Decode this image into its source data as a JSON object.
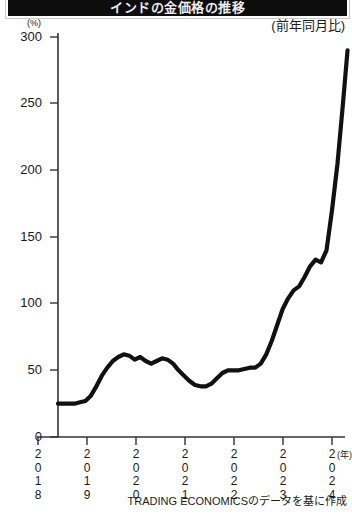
{
  "titlebar": {
    "text": "インドの金価格の推移"
  },
  "annotations": {
    "y_unit": "(%)",
    "x_unit": "(年)",
    "yoy_note": "(前年同月比)",
    "source": "TRADING ECONOMICSのデータを基に作成"
  },
  "axis": {
    "y_ticks": [
      "300",
      "250",
      "200",
      "150",
      "100",
      "50",
      "0"
    ],
    "x_ticks": [
      {
        "digits": [
          "2",
          "0",
          "1",
          "8"
        ]
      },
      {
        "digits": [
          "2",
          "0",
          "1",
          "9"
        ]
      },
      {
        "digits": [
          "2",
          "0",
          "2",
          "0"
        ]
      },
      {
        "digits": [
          "2",
          "0",
          "2",
          "1"
        ]
      },
      {
        "digits": [
          "2",
          "0",
          "2",
          "2"
        ]
      },
      {
        "digits": [
          "2",
          "0",
          "2",
          "3"
        ]
      },
      {
        "digits": [
          "2",
          "0",
          "2",
          "4"
        ]
      }
    ]
  },
  "colors": {
    "line": "#111111",
    "axis": "#333333",
    "background": "#ffffff",
    "titlebar": "#0d0d0d"
  },
  "chart_data": {
    "type": "line",
    "title": "インドの金価格の推移",
    "subtitle": "(前年同月比)",
    "xlabel": "(年)",
    "ylabel": "(%)",
    "xlim": [
      2018.0,
      2024.4
    ],
    "ylim": [
      0,
      300
    ],
    "ytick_values": [
      0,
      50,
      100,
      150,
      200,
      250,
      300
    ],
    "xtick_values": [
      2018,
      2019,
      2020,
      2021,
      2022,
      2023,
      2024
    ],
    "grid": false,
    "legend": null,
    "source": "TRADING ECONOMICSのデータを基に作成",
    "series": [
      {
        "name": "前年同月比",
        "x": [
          2018.0,
          2018.12,
          2018.24,
          2018.36,
          2018.48,
          2018.6,
          2018.72,
          2018.84,
          2018.96,
          2019.08,
          2019.2,
          2019.32,
          2019.44,
          2019.56,
          2019.68,
          2019.8,
          2019.92,
          2020.04,
          2020.16,
          2020.28,
          2020.4,
          2020.52,
          2020.64,
          2020.76,
          2020.88,
          2021.0,
          2021.12,
          2021.24,
          2021.36,
          2021.48,
          2021.6,
          2021.72,
          2021.84,
          2021.96,
          2022.08,
          2022.2,
          2022.32,
          2022.44,
          2022.56,
          2022.68,
          2022.8,
          2022.92,
          2023.04,
          2023.16,
          2023.28,
          2023.4,
          2023.52,
          2023.64,
          2023.76,
          2023.88,
          2024.0,
          2024.12,
          2024.24,
          2024.34
        ],
        "y": [
          25,
          25,
          25,
          25,
          26,
          27,
          31,
          38,
          46,
          52,
          57,
          60,
          62,
          61,
          58,
          60,
          57,
          55,
          57,
          59,
          58,
          55,
          50,
          46,
          42,
          39,
          38,
          38,
          40,
          44,
          48,
          50,
          50,
          50,
          51,
          52,
          52,
          55,
          62,
          72,
          84,
          96,
          104,
          110,
          113,
          120,
          128,
          133,
          131,
          140,
          170,
          205,
          250,
          290
        ]
      }
    ]
  }
}
